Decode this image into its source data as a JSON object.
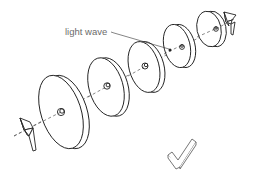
{
  "diagram": {
    "label": "light wave",
    "colors": {
      "line": "#222222",
      "label": "#6b6b6b",
      "background": "#ffffff",
      "check": "#666666"
    },
    "components": {
      "disks": [
        {
          "name": "disk-1",
          "cx": 62,
          "cy": 112,
          "rx": 20,
          "ry": 38
        },
        {
          "name": "disk-2",
          "cx": 107,
          "cy": 87,
          "rx": 17,
          "ry": 30
        },
        {
          "name": "disk-3",
          "cx": 145,
          "cy": 67,
          "rx": 15,
          "ry": 26
        },
        {
          "name": "disk-4",
          "cx": 178,
          "cy": 46,
          "rx": 13,
          "ry": 22
        },
        {
          "name": "disk-5",
          "cx": 211,
          "cy": 29,
          "rx": 12,
          "ry": 18
        }
      ],
      "end_elements": [
        "left-prism",
        "right-prism"
      ],
      "icons": [
        "checkmark-icon"
      ]
    }
  }
}
